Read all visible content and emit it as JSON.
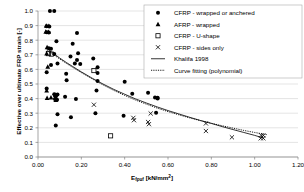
{
  "chart_data": {
    "type": "scatter",
    "title": "",
    "xlabel": "Efρuf [kN/mm2]",
    "xlabel_base": "E",
    "xlabel_sub": "fρuf",
    "xlabel_unit": " [kN/mm",
    "xlabel_sup": "2",
    "xlabel_close": "]",
    "ylabel": "Effective over ultimate FRP strain [-]",
    "xlim": [
      0.0,
      1.2
    ],
    "ylim": [
      0.0,
      1.0
    ],
    "grid": true,
    "grid_axis": "y",
    "legend_position": "top-right",
    "xticks": [
      "0.00",
      "0.20",
      "0.40",
      "0.60",
      "0.80",
      "1.00",
      "1.20"
    ],
    "xtick_values": [
      0.0,
      0.2,
      0.4,
      0.6,
      0.8,
      1.0,
      1.2
    ],
    "yticks": [
      "0.0",
      "0.1",
      "0.2",
      "0.3",
      "0.4",
      "0.5",
      "0.6",
      "0.7",
      "0.8",
      "0.9",
      "1.0"
    ],
    "ytick_values": [
      0.0,
      0.1,
      0.2,
      0.3,
      0.4,
      0.5,
      0.6,
      0.7,
      0.8,
      0.9,
      1.0
    ],
    "series": [
      {
        "name": "CFRP - wrapped or anchered",
        "marker": "filled-circle",
        "points": [
          [
            0.055,
            1.0
          ],
          [
            0.075,
            1.0
          ],
          [
            0.04,
            0.895
          ],
          [
            0.052,
            0.893
          ],
          [
            0.04,
            0.855
          ],
          [
            0.05,
            0.852
          ],
          [
            0.085,
            0.793
          ],
          [
            0.18,
            0.85
          ],
          [
            0.05,
            0.745
          ],
          [
            0.06,
            0.742
          ],
          [
            0.075,
            0.705
          ],
          [
            0.16,
            0.775
          ],
          [
            0.185,
            0.71
          ],
          [
            0.06,
            0.63
          ],
          [
            0.09,
            0.64
          ],
          [
            0.15,
            0.688
          ],
          [
            0.18,
            0.665
          ],
          [
            0.17,
            0.64
          ],
          [
            0.195,
            0.637
          ],
          [
            0.255,
            0.675
          ],
          [
            0.275,
            0.615
          ],
          [
            0.04,
            0.58
          ],
          [
            0.13,
            0.57
          ],
          [
            0.275,
            0.575
          ],
          [
            0.132,
            0.525
          ],
          [
            0.275,
            0.52
          ],
          [
            0.4,
            0.515
          ],
          [
            0.04,
            0.47
          ],
          [
            0.27,
            0.455
          ],
          [
            0.075,
            0.43
          ],
          [
            0.09,
            0.428
          ],
          [
            0.082,
            0.415
          ],
          [
            0.125,
            0.412
          ],
          [
            0.078,
            0.398
          ],
          [
            0.088,
            0.392
          ],
          [
            0.175,
            0.398
          ],
          [
            0.435,
            0.433
          ],
          [
            0.508,
            0.44
          ],
          [
            0.54,
            0.408
          ],
          [
            0.552,
            0.405
          ],
          [
            0.552,
            0.4
          ],
          [
            0.265,
            0.3
          ],
          [
            0.09,
            0.292
          ],
          [
            0.152,
            0.272
          ],
          [
            0.395,
            0.283
          ],
          [
            0.545,
            0.303
          ],
          [
            0.082,
            0.215
          ]
        ]
      },
      {
        "name": "AFRP - wrapped",
        "marker": "filled-triangle",
        "points": [
          [
            0.038,
            0.9
          ],
          [
            0.05,
            0.898
          ],
          [
            0.036,
            0.858
          ],
          [
            0.048,
            0.856
          ],
          [
            0.042,
            0.752
          ],
          [
            0.04,
            0.71
          ],
          [
            0.045,
            0.618
          ],
          [
            0.04,
            0.455
          ],
          [
            0.042,
            0.405
          ],
          [
            0.06,
            0.408
          ],
          [
            0.08,
            0.425
          ],
          [
            0.082,
            0.39
          ]
        ]
      },
      {
        "name": "CFRP - U-shape",
        "marker": "open-square",
        "points": [
          [
            0.048,
            0.708
          ],
          [
            0.062,
            0.705
          ],
          [
            0.258,
            0.592
          ],
          [
            0.335,
            0.145
          ]
        ]
      },
      {
        "name": "CFRP - sides only",
        "marker": "cross",
        "points": [
          [
            0.258,
            0.358
          ],
          [
            0.44,
            0.268
          ],
          [
            0.443,
            0.252
          ],
          [
            0.508,
            0.24
          ],
          [
            0.512,
            0.225
          ],
          [
            0.52,
            0.298
          ],
          [
            0.775,
            0.23
          ],
          [
            0.775,
            0.178
          ],
          [
            0.895,
            0.135
          ],
          [
            1.03,
            0.148
          ],
          [
            1.04,
            0.148
          ],
          [
            1.028,
            0.128
          ],
          [
            1.04,
            0.128
          ]
        ]
      }
    ],
    "lines": [
      {
        "name": "Khalifa 1998",
        "style": "solid",
        "points": [
          [
            0.04,
            0.745
          ],
          [
            0.06,
            0.722
          ],
          [
            0.08,
            0.7
          ],
          [
            0.1,
            0.678
          ],
          [
            0.13,
            0.648
          ],
          [
            0.16,
            0.62
          ],
          [
            0.2,
            0.583
          ],
          [
            0.25,
            0.54
          ],
          [
            0.3,
            0.5
          ],
          [
            0.35,
            0.463
          ],
          [
            0.4,
            0.43
          ],
          [
            0.45,
            0.398
          ],
          [
            0.5,
            0.37
          ],
          [
            0.55,
            0.343
          ],
          [
            0.6,
            0.318
          ],
          [
            0.65,
            0.295
          ],
          [
            0.7,
            0.272
          ],
          [
            0.75,
            0.25
          ],
          [
            0.8,
            0.23
          ],
          [
            0.85,
            0.208
          ],
          [
            0.9,
            0.188
          ],
          [
            0.95,
            0.168
          ],
          [
            1.0,
            0.148
          ],
          [
            1.04,
            0.13
          ]
        ]
      },
      {
        "name": "Curve fitting (polynomial)",
        "style": "dotted",
        "points": [
          [
            0.04,
            0.733
          ],
          [
            0.06,
            0.712
          ],
          [
            0.08,
            0.692
          ],
          [
            0.1,
            0.672
          ],
          [
            0.13,
            0.642
          ],
          [
            0.16,
            0.614
          ],
          [
            0.2,
            0.578
          ],
          [
            0.25,
            0.535
          ],
          [
            0.3,
            0.494
          ],
          [
            0.35,
            0.456
          ],
          [
            0.4,
            0.422
          ],
          [
            0.45,
            0.39
          ],
          [
            0.5,
            0.362
          ],
          [
            0.55,
            0.335
          ],
          [
            0.6,
            0.311
          ],
          [
            0.65,
            0.289
          ],
          [
            0.7,
            0.268
          ],
          [
            0.75,
            0.249
          ],
          [
            0.8,
            0.231
          ],
          [
            0.85,
            0.214
          ],
          [
            0.9,
            0.198
          ],
          [
            0.95,
            0.182
          ],
          [
            1.0,
            0.168
          ],
          [
            1.06,
            0.152
          ]
        ]
      }
    ]
  },
  "legend": {
    "entries": [
      {
        "label": "CFRP - wrapped or anchered",
        "marker": "filled-circle"
      },
      {
        "label": "AFRP - wrapped",
        "marker": "filled-triangle"
      },
      {
        "label": "CFRP - U-shape",
        "marker": "open-square"
      },
      {
        "label": "CFRP - sides only",
        "marker": "cross"
      },
      {
        "label": "Khalifa 1998",
        "marker": "solid-line"
      },
      {
        "label": "Curve fitting (polynomial)",
        "marker": "dotted-line"
      }
    ]
  },
  "colors": {
    "marker": "#000000",
    "grid": "#c8c8c8",
    "axis": "#808080",
    "background": "#ffffff",
    "legend_border": "#aaaaaa"
  }
}
